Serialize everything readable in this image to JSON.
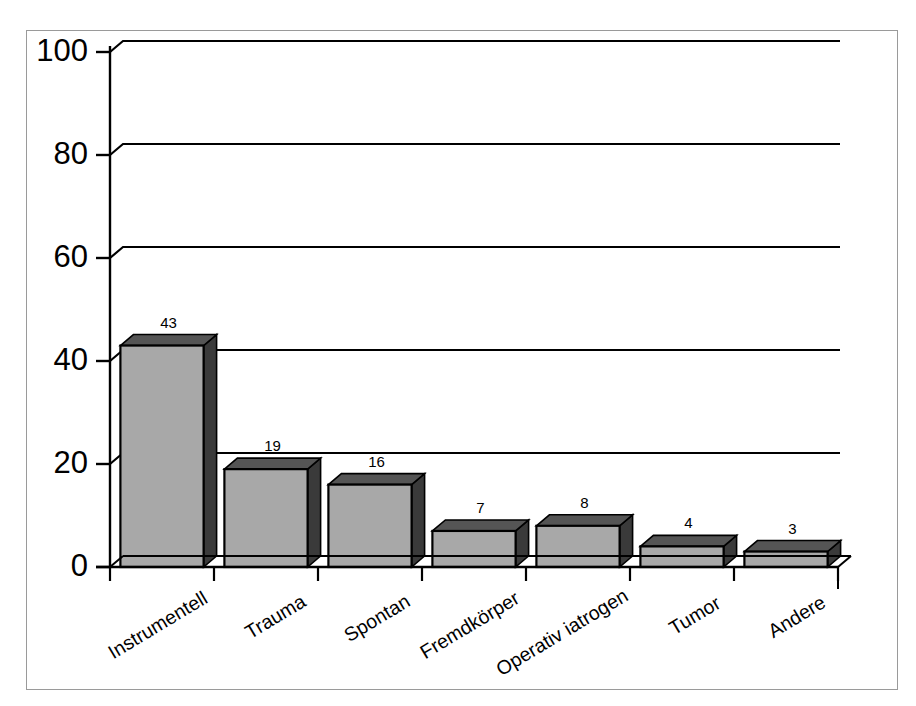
{
  "chart_data": {
    "type": "bar",
    "title": "",
    "subtitle": "",
    "xlabel": "",
    "ylabel": "",
    "categories": [
      "Instrumentell",
      "Trauma",
      "Spontan",
      "Fremdkörper",
      "Operativ iatrogen",
      "Tumor",
      "Andere"
    ],
    "values": [
      43,
      19,
      16,
      7,
      8,
      4,
      3
    ],
    "value_labels": [
      "43",
      "19",
      "16",
      "7",
      "8",
      "4",
      "3"
    ],
    "ylim": [
      0,
      100
    ],
    "ytick_values": [
      0,
      20,
      40,
      60,
      80,
      100
    ],
    "ytick_labels": [
      "0",
      "20",
      "40",
      "60",
      "80",
      "100"
    ],
    "grid": true,
    "grid_axis": "y",
    "legend": false,
    "legend_position": "none",
    "style": "3d-bar",
    "bar_face_color": "#a8a8a8",
    "bar_edge_color": "#000000",
    "bar_top_color": "#555555",
    "bar_side_color": "#3a3a3a",
    "axis_color": "#000000",
    "grid_color": "#000000",
    "frame_color": "#9a9a9a",
    "background_color": "#ffffff"
  },
  "figure": {
    "frame_label": "chart-frame",
    "plot_label": "plot-area"
  }
}
